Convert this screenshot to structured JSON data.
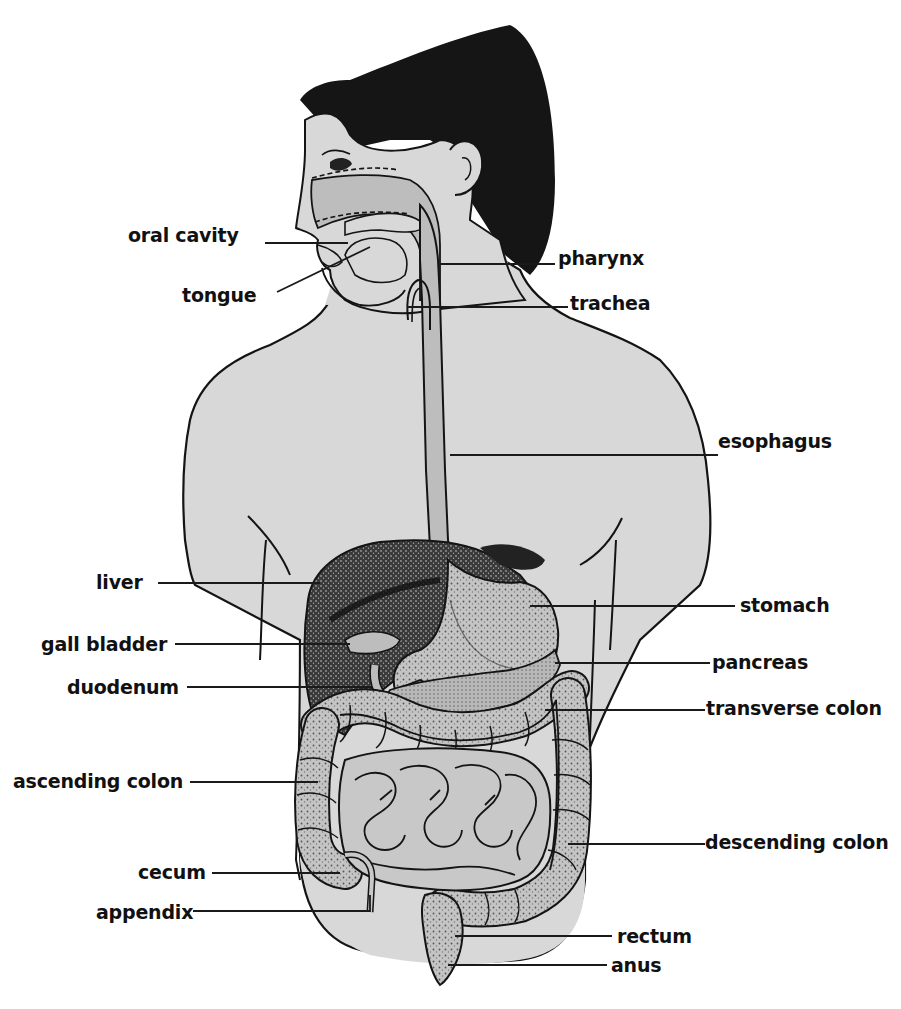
{
  "diagram": {
    "colors": {
      "body": "#d9d9d9",
      "body_shade": "#cfcfcf",
      "hair": "#151515",
      "organ_mid": "#bdbdbd",
      "organ_dark": "#2a2a2a",
      "outline": "#141414",
      "leader": "#1a1a1a",
      "text": "#111111"
    },
    "labels": {
      "oral_cavity": "oral cavity",
      "tongue": "tongue",
      "pharynx": "pharynx",
      "trachea": "trachea",
      "esophagus": "esophagus",
      "liver": "liver",
      "stomach": "stomach",
      "gall_bladder": "gall bladder",
      "pancreas": "pancreas",
      "duodenum": "duodenum",
      "transverse_colon": "transverse colon",
      "ascending_colon": "ascending colon",
      "descending_colon": "descending colon",
      "cecum": "cecum",
      "appendix": "appendix",
      "rectum": "rectum",
      "anus": "anus"
    }
  }
}
